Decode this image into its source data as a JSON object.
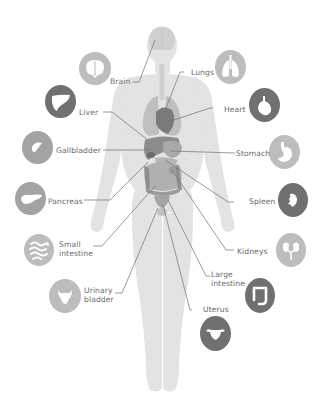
{
  "diagram": {
    "type": "anatomy-infographic",
    "colors": {
      "background": "#ffffff",
      "body": "#e3e3e3",
      "organ_light": "#c4c4c4",
      "organ_dark": "#7a7a7a",
      "icon_light": "#bdbdbd",
      "icon_mid": "#a3a3a3",
      "icon_dark": "#707070",
      "leader_line": "#707070",
      "label_text": "#6a6a6a"
    },
    "organs": [
      {
        "id": "brain",
        "label": "Brain",
        "icon": "brain-icon",
        "tone": "light",
        "side": "left"
      },
      {
        "id": "lungs",
        "label": "Lungs",
        "icon": "lungs-icon",
        "tone": "light",
        "side": "right"
      },
      {
        "id": "liver",
        "label": "Liver",
        "icon": "liver-icon",
        "tone": "dark",
        "side": "left"
      },
      {
        "id": "heart",
        "label": "Heart",
        "icon": "heart-icon",
        "tone": "dark",
        "side": "right"
      },
      {
        "id": "gallbladder",
        "label": "Gallbladder",
        "icon": "gallbladder-icon",
        "tone": "mid",
        "side": "left"
      },
      {
        "id": "stomach",
        "label": "Stomach",
        "icon": "stomach-icon",
        "tone": "light",
        "side": "right"
      },
      {
        "id": "pancreas",
        "label": "Pancreas",
        "icon": "pancreas-icon",
        "tone": "mid",
        "side": "left"
      },
      {
        "id": "spleen",
        "label": "Spleen",
        "icon": "spleen-icon",
        "tone": "dark",
        "side": "right"
      },
      {
        "id": "small_intestine",
        "label_line1": "Small",
        "label_line2": "intestine",
        "icon": "small-intestine-icon",
        "tone": "light",
        "side": "left"
      },
      {
        "id": "kidneys",
        "label": "Kidneys",
        "icon": "kidneys-icon",
        "tone": "light",
        "side": "right"
      },
      {
        "id": "urinary_bladder",
        "label_line1": "Urinary",
        "label_line2": "bladder",
        "icon": "urinary-bladder-icon",
        "tone": "light",
        "side": "left"
      },
      {
        "id": "large_intestine",
        "label_line1": "Large",
        "label_line2": "intestine",
        "icon": "large-intestine-icon",
        "tone": "dark",
        "side": "right"
      },
      {
        "id": "uterus",
        "label": "Uterus",
        "icon": "uterus-icon",
        "tone": "dark",
        "side": "right"
      }
    ]
  },
  "labels": {
    "brain": "Brain",
    "lungs": "Lungs",
    "liver": "Liver",
    "heart": "Heart",
    "gallbladder": "Gallbladder",
    "stomach": "Stomach",
    "pancreas": "Pancreas",
    "spleen": "Spleen",
    "small_intestine_1": "Small",
    "small_intestine_2": "intestine",
    "kidneys": "Kidneys",
    "urinary_bladder_1": "Urinary",
    "urinary_bladder_2": "bladder",
    "large_intestine_1": "Large",
    "large_intestine_2": "intestine",
    "uterus": "Uterus"
  }
}
